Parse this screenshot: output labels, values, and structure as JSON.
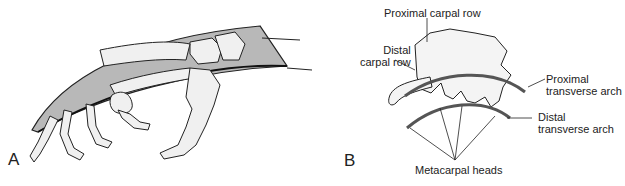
{
  "figure": {
    "panel_a": {
      "letter": "A"
    },
    "panel_b": {
      "letter": "B",
      "labels": {
        "proximal_carpal_row": "Proximal carpal row",
        "distal_carpal_row_line1": "Distal",
        "distal_carpal_row_line2": "carpal row",
        "proximal_arch_line1": "Proximal",
        "proximal_arch_line2": "transverse arch",
        "distal_arch_line1": "Distal",
        "distal_arch_line2": "transverse arch",
        "metacarpal_heads": "Metacarpal heads"
      }
    },
    "colors": {
      "band_fill": "#b8b8b8",
      "line": "#222222",
      "bone_fill": "#f4f4f4",
      "arch": "#555555"
    }
  }
}
